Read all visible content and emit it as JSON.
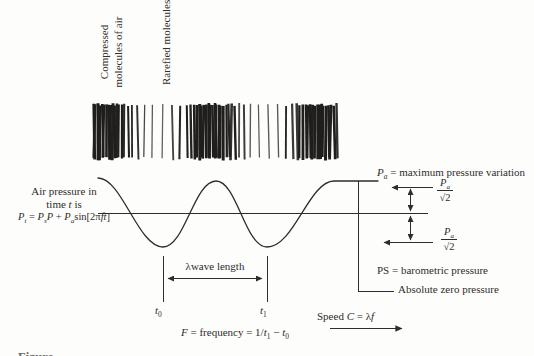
{
  "colors": {
    "ink": "#2e2d2b",
    "paper": "#fdfdfc",
    "stripe": "#1f1e1c"
  },
  "top_labels": {
    "compressed_line1": "Compressed",
    "compressed_line2": "molecules of air",
    "rarefied": "Rarefied molecules"
  },
  "left_label": {
    "line1": "Air pressure in",
    "line2_parts": [
      {
        "t": "time "
      },
      {
        "t": "t",
        "s": "i"
      },
      {
        "t": " is"
      }
    ],
    "formula_parts": [
      {
        "t": "P",
        "s": "i"
      },
      {
        "t": "t",
        "s": "isub"
      },
      {
        "t": " = "
      },
      {
        "t": "P",
        "s": "i"
      },
      {
        "t": "s",
        "s": "isub"
      },
      {
        "t": "P",
        "s": "i"
      },
      {
        "t": " + "
      },
      {
        "t": "P",
        "s": "i"
      },
      {
        "t": "a",
        "s": "isub"
      },
      {
        "t": "sin[2π"
      },
      {
        "t": "ft",
        "s": "i"
      },
      {
        "t": "]"
      }
    ]
  },
  "right_labels": {
    "pa_max_parts": [
      {
        "t": "P",
        "s": "i"
      },
      {
        "t": "a",
        "s": "isub"
      },
      {
        "t": " = maximum pressure variation"
      }
    ],
    "rms_top_num_parts": [
      {
        "t": "P",
        "s": "i"
      },
      {
        "t": "a",
        "s": "isub"
      }
    ],
    "rms_top_den": "√2",
    "rms_bottom_num_parts": [
      {
        "t": "P",
        "s": "i"
      },
      {
        "t": "a",
        "s": "isub"
      }
    ],
    "rms_bottom_den": "√2",
    "barometric": "PS = barometric pressure",
    "absolute_zero": "Absolute zero pressure"
  },
  "bottom_labels": {
    "wavelength": "λwave length",
    "t0_parts": [
      {
        "t": "t",
        "s": "i"
      },
      {
        "t": "0",
        "s": "sub"
      }
    ],
    "t1_parts": [
      {
        "t": "t",
        "s": "i"
      },
      {
        "t": "1",
        "s": "sub"
      }
    ],
    "frequency_parts": [
      {
        "t": "F",
        "s": "i"
      },
      {
        "t": " = frequency = 1/"
      },
      {
        "t": "t",
        "s": "i"
      },
      {
        "t": "1",
        "s": "sub"
      },
      {
        "t": " − "
      },
      {
        "t": "t",
        "s": "i"
      },
      {
        "t": "0",
        "s": "sub"
      }
    ],
    "speed_parts": [
      {
        "t": "Speed "
      },
      {
        "t": "C",
        "s": "i"
      },
      {
        "t": " = λ"
      },
      {
        "t": "f",
        "s": "i"
      }
    ]
  },
  "caption": {
    "text": "Figure"
  }
}
